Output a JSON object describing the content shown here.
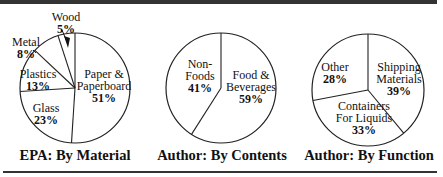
{
  "chart_data": [
    {
      "type": "pie",
      "title": "EPA: By Material",
      "slices": [
        {
          "label": "Paper & Paperboard",
          "value": 51
        },
        {
          "label": "Glass",
          "value": 23
        },
        {
          "label": "Plastics",
          "value": 13
        },
        {
          "label": "Metal",
          "value": 8
        },
        {
          "label": "Wood",
          "value": 5
        }
      ]
    },
    {
      "type": "pie",
      "title": "Author: By Contents",
      "slices": [
        {
          "label": "Food & Beverages",
          "value": 59
        },
        {
          "label": "Non-Foods",
          "value": 41
        }
      ]
    },
    {
      "type": "pie",
      "title": "Author: By Function",
      "slices": [
        {
          "label": "Shipping Materials",
          "value": 39
        },
        {
          "label": "Containers For Liquids",
          "value": 33
        },
        {
          "label": "Other",
          "value": 28
        }
      ]
    }
  ],
  "pies": [
    {
      "cx": 75,
      "cy": 88,
      "r": 55,
      "start_deg": 0,
      "labels": [
        {
          "lines": [
            "Paper &",
            "Paperboard"
          ],
          "pct": "51%",
          "x": 104,
          "y": 78
        },
        {
          "lines": [
            "Glass"
          ],
          "pct": "23%",
          "x": 46,
          "y": 112
        },
        {
          "lines": [
            "Plastics"
          ],
          "pct": "13%",
          "x": 38,
          "y": 78
        },
        {
          "lines": [
            "Metal"
          ],
          "pct": "8%",
          "x": 26,
          "y": 46,
          "leader": [
            33,
            50,
            36,
            53
          ]
        },
        {
          "lines": [
            "Wood"
          ],
          "pct": "5%",
          "x": 66,
          "y": 21,
          "arrow": true
        }
      ]
    },
    {
      "cx": 221,
      "cy": 88,
      "r": 55,
      "start_deg": 0,
      "labels": [
        {
          "lines": [
            "Food &",
            "Beverages"
          ],
          "pct": "59%",
          "x": 251,
          "y": 79
        },
        {
          "lines": [
            "Non-",
            "Foods"
          ],
          "pct": "41%",
          "x": 200,
          "y": 68
        }
      ]
    },
    {
      "cx": 368,
      "cy": 90,
      "r": 56,
      "start_deg": 0,
      "labels": [
        {
          "lines": [
            "Shipping",
            "Materials"
          ],
          "pct": "39%",
          "x": 399,
          "y": 71
        },
        {
          "lines": [
            "Containers",
            "For Liquids"
          ],
          "pct": "33%",
          "x": 364,
          "y": 110
        },
        {
          "lines": [
            "Other"
          ],
          "pct": "28%",
          "x": 335,
          "y": 71
        }
      ]
    }
  ],
  "titles": [
    "EPA: By Material",
    "Author: By Contents",
    "Author: By Function"
  ]
}
